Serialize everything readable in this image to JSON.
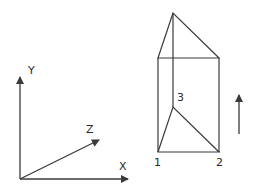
{
  "axes": {
    "x_label": "X",
    "y_label": "Y",
    "z_label": "Z"
  },
  "prism": {
    "vertex_labels": [
      "1",
      "2",
      "3"
    ]
  },
  "arrow": {
    "direction": "up"
  },
  "colors": {
    "stroke": "#3a3a3a",
    "background": "#ffffff"
  }
}
